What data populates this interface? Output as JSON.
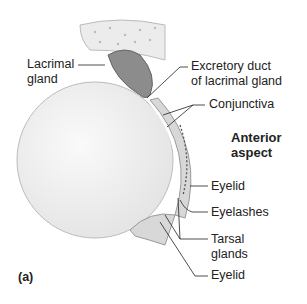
{
  "figure_label": "(a)",
  "labels": {
    "lacrimal_gland": [
      "Lacrimal",
      "gland"
    ],
    "excretory_duct": [
      "Excretory duct",
      "of lacrimal gland"
    ],
    "conjunctiva": "Conjunctiva",
    "anterior_aspect": [
      "Anterior",
      "aspect"
    ],
    "eyelid_upper": "Eyelid",
    "eyelashes": "Eyelashes",
    "tarsal_glands": [
      "Tarsal",
      "glands"
    ],
    "eyelid_lower": "Eyelid"
  },
  "colors": {
    "eyeball": "#f2f2f2",
    "gland": "#8a8a8a",
    "bone": "#e8e8e8",
    "line": "#222222"
  }
}
